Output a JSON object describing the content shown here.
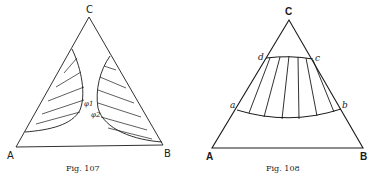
{
  "fig107": {
    "caption": "Fig. 107",
    "vertices": {
      "A": "A",
      "B": "B",
      "C": "C"
    },
    "phase_labels": [
      "φ1",
      "φ2"
    ]
  },
  "fig108": {
    "caption": "Fig. 108",
    "vertices": {
      "A": "A",
      "B": "B",
      "C": "C"
    },
    "point_labels": {
      "a": "a",
      "b": "b",
      "c": "c",
      "d": "d"
    }
  },
  "colors": {
    "ink": "#1a1a1a",
    "background": "#ffffff"
  }
}
